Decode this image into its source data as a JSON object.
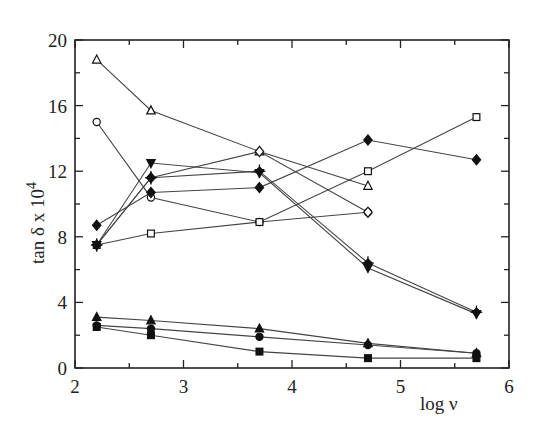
{
  "chart_data": {
    "type": "line",
    "title": "",
    "xlabel": "log ν",
    "ylabel": "tan δ x 10 4",
    "ylabel_parts": {
      "main": "tan δ x 10",
      "superscript": "4"
    },
    "xlim": [
      2,
      6
    ],
    "ylim": [
      0,
      20
    ],
    "x_ticks": [
      2,
      3,
      4,
      5,
      6
    ],
    "y_ticks": [
      0,
      4,
      8,
      12,
      16,
      20
    ],
    "grid": false,
    "legend": "none",
    "series": [
      {
        "name": "open-triangle",
        "marker": "triangle-open",
        "x": [
          2.2,
          2.7,
          3.7,
          4.7
        ],
        "values": [
          18.8,
          15.7,
          13.2,
          11.1
        ]
      },
      {
        "name": "open-circle",
        "marker": "circle-open",
        "x": [
          2.2,
          2.7,
          3.7,
          4.7
        ],
        "values": [
          15.0,
          10.4,
          8.9,
          9.5
        ]
      },
      {
        "name": "open-square",
        "marker": "square-open",
        "x": [
          2.2,
          2.7,
          3.7,
          4.7,
          5.7
        ],
        "values": [
          7.5,
          8.2,
          8.9,
          12.0,
          15.3
        ]
      },
      {
        "name": "open-diamond",
        "marker": "diamond-open",
        "x": [
          2.2,
          2.7,
          3.7,
          4.7
        ],
        "values": [
          7.5,
          11.6,
          13.2,
          9.5
        ]
      },
      {
        "name": "filled-diamond",
        "marker": "diamond-filled",
        "x": [
          2.2,
          2.7,
          3.7,
          4.7,
          5.7
        ],
        "values": [
          8.7,
          10.7,
          11.0,
          13.9,
          12.7
        ]
      },
      {
        "name": "down-triangle",
        "marker": "triangle-down-filled",
        "x": [
          2.2,
          2.7,
          3.7,
          4.7,
          5.7
        ],
        "values": [
          7.5,
          12.5,
          11.9,
          6.1,
          3.3
        ]
      },
      {
        "name": "plus",
        "marker": "plus-diamond",
        "x": [
          2.2,
          2.7,
          3.7,
          4.7,
          5.7
        ],
        "values": [
          7.5,
          11.6,
          12.0,
          6.4,
          3.4
        ]
      },
      {
        "name": "filled-triangle",
        "marker": "triangle-filled",
        "x": [
          2.2,
          2.7,
          3.7,
          4.7,
          5.7
        ],
        "values": [
          3.1,
          2.9,
          2.4,
          1.5,
          0.9
        ]
      },
      {
        "name": "filled-circle",
        "marker": "circle-filled",
        "x": [
          2.2,
          2.7,
          3.7,
          4.7,
          5.7
        ],
        "values": [
          2.6,
          2.4,
          1.9,
          1.4,
          0.9
        ]
      },
      {
        "name": "filled-square",
        "marker": "square-filled",
        "x": [
          2.2,
          2.7,
          3.7,
          4.7,
          5.7
        ],
        "values": [
          2.5,
          2.0,
          1.0,
          0.6,
          0.6
        ]
      }
    ]
  },
  "colors": {
    "line": "#444444",
    "axis": "#222222",
    "marker_fill": "#111111",
    "background": "#ffffff"
  }
}
